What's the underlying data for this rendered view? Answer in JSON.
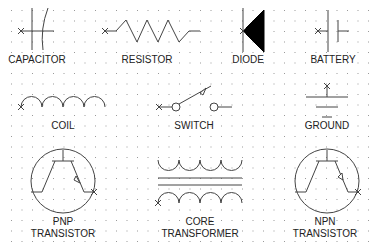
{
  "diagram": {
    "grid": {
      "spacing": 10.5,
      "dot_color": "#9a9a9a"
    },
    "symbols": [
      {
        "id": "capacitor",
        "label": "CAPACITOR"
      },
      {
        "id": "resistor",
        "label": "RESISTOR"
      },
      {
        "id": "diode",
        "label": "DIODE"
      },
      {
        "id": "battery",
        "label": "BATTERY"
      },
      {
        "id": "coil",
        "label": "COIL"
      },
      {
        "id": "switch",
        "label": "SWITCH"
      },
      {
        "id": "ground",
        "label": "GROUND"
      },
      {
        "id": "pnp",
        "label_line1": "PNP",
        "label_line2": "TRANSISTOR"
      },
      {
        "id": "transformer",
        "label_line1": "CORE",
        "label_line2": "TRANSFORMER"
      },
      {
        "id": "npn",
        "label_line1": "NPN",
        "label_line2": "TRANSISTOR"
      }
    ],
    "colors": {
      "line": "#444444",
      "fill": "#000000",
      "text": "#222222"
    }
  }
}
